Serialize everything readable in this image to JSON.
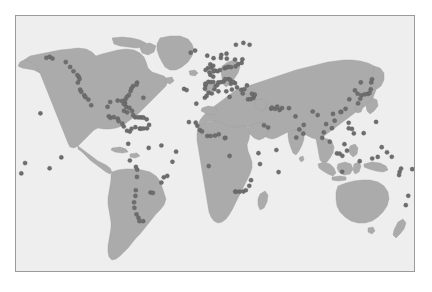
{
  "figure": {
    "title": "",
    "caption": "",
    "width": 432,
    "height": 292,
    "background_color": "#ffffff"
  },
  "map": {
    "frame": {
      "x": 15,
      "y": 15,
      "width": 400,
      "height": 257,
      "border_color": "#9a9a9a",
      "border_width": 1
    },
    "ocean_color": "#eeeeee",
    "land_color": "#ababab",
    "land_outline_color": "#9c9c9c",
    "point_fill_color": "#6e6e6e",
    "point_stroke_color": "#595959",
    "point_radius": 2.1,
    "projection": "equirectangular",
    "lon_range": [
      -180,
      180
    ],
    "lat_range": [
      -90,
      90
    ],
    "graticule": false,
    "axis_labels": false,
    "tick_labels": false,
    "legend": false
  },
  "chart_data": {
    "type": "scatter",
    "title": "",
    "xlabel": "Longitude",
    "ylabel": "Latitude",
    "xlim": [
      -180,
      180
    ],
    "ylim": [
      -90,
      90
    ],
    "grid": false,
    "legend_position": "none",
    "marker": {
      "shape": "circle",
      "size": 2.1,
      "color": "#6e6e6e"
    },
    "series": [
      {
        "name": "sample-locations",
        "count": 201,
        "regions": {
          "north_america_west": 16,
          "north_america_east": 14,
          "caribbean_central_america": 27,
          "south_america": 19,
          "europe_mediterranean": 41,
          "africa": 11,
          "middle_east_south_asia": 13,
          "east_asia_japan": 17,
          "southeast_asia_oceania": 29,
          "open_ocean_islands": 14
        },
        "points": [
          [
            -152.5,
            60.5
          ],
          [
            -149.5,
            61.2
          ],
          [
            -147.0,
            60.0
          ],
          [
            -135.0,
            57.5
          ],
          [
            -131.0,
            54.0
          ],
          [
            -128.0,
            51.0
          ],
          [
            -124.5,
            48.3
          ],
          [
            -123.2,
            47.0
          ],
          [
            -122.5,
            45.5
          ],
          [
            -124.0,
            43.0
          ],
          [
            -122.0,
            38.0
          ],
          [
            -121.0,
            36.5
          ],
          [
            -118.2,
            34.0
          ],
          [
            -117.2,
            32.7
          ],
          [
            -114.5,
            31.0
          ],
          [
            -112.0,
            27.0
          ],
          [
            -70.5,
            43.0
          ],
          [
            -71.0,
            41.5
          ],
          [
            -74.0,
            40.6
          ],
          [
            -75.5,
            39.0
          ],
          [
            -76.4,
            37.0
          ],
          [
            -77.9,
            34.2
          ],
          [
            -79.9,
            32.8
          ],
          [
            -81.1,
            31.0
          ],
          [
            -81.4,
            28.5
          ],
          [
            -80.2,
            25.8
          ],
          [
            -82.5,
            27.8
          ],
          [
            -84.3,
            30.0
          ],
          [
            -88.0,
            30.3
          ],
          [
            -94.8,
            29.3
          ],
          [
            -97.2,
            25.9
          ],
          [
            -96.0,
            19.2
          ],
          [
            -94.5,
            18.1
          ],
          [
            -91.5,
            18.6
          ],
          [
            -88.0,
            17.5
          ],
          [
            -87.2,
            15.8
          ],
          [
            -83.9,
            14.0
          ],
          [
            -82.5,
            12.0
          ],
          [
            -79.6,
            9.0
          ],
          [
            -77.0,
            8.4
          ],
          [
            -75.5,
            10.4
          ],
          [
            -72.0,
            11.5
          ],
          [
            -68.0,
            10.5
          ],
          [
            -66.9,
            10.5
          ],
          [
            -64.6,
            10.6
          ],
          [
            -61.5,
            10.7
          ],
          [
            -82.3,
            23.1
          ],
          [
            -79.5,
            22.0
          ],
          [
            -77.4,
            25.1
          ],
          [
            -75.0,
            23.0
          ],
          [
            -74.0,
            20.0
          ],
          [
            -72.3,
            18.5
          ],
          [
            -70.0,
            18.5
          ],
          [
            -68.0,
            18.4
          ],
          [
            -66.1,
            18.4
          ],
          [
            -64.7,
            18.3
          ],
          [
            -61.8,
            17.1
          ],
          [
            -78.5,
            -0.2
          ],
          [
            -77.0,
            -12.0
          ],
          [
            -71.5,
            -16.5
          ],
          [
            -70.4,
            -18.5
          ],
          [
            -70.6,
            -23.6
          ],
          [
            -71.6,
            -33.0
          ],
          [
            -72.0,
            -37.0
          ],
          [
            -73.2,
            -41.5
          ],
          [
            -72.9,
            -45.4
          ],
          [
            -71.0,
            -50.0
          ],
          [
            -69.2,
            -52.5
          ],
          [
            -68.3,
            -54.8
          ],
          [
            -65.0,
            -54.8
          ],
          [
            -58.4,
            -34.6
          ],
          [
            -56.2,
            -34.9
          ],
          [
            -48.5,
            -27.6
          ],
          [
            -46.3,
            -23.9
          ],
          [
            -43.2,
            -22.9
          ],
          [
            -38.5,
            -12.9
          ],
          [
            -35.2,
            -5.8
          ],
          [
            -60.0,
            -3.1
          ],
          [
            -48.5,
            -1.4
          ],
          [
            -9.1,
            38.7
          ],
          [
            -8.6,
            41.1
          ],
          [
            -8.7,
            42.2
          ],
          [
            -6.0,
            43.5
          ],
          [
            -3.8,
            43.4
          ],
          [
            -1.5,
            43.4
          ],
          [
            -0.5,
            38.3
          ],
          [
            0.6,
            40.6
          ],
          [
            2.2,
            41.4
          ],
          [
            3.0,
            43.1
          ],
          [
            5.4,
            43.3
          ],
          [
            7.8,
            43.7
          ],
          [
            9.2,
            45.4
          ],
          [
            12.3,
            45.4
          ],
          [
            13.8,
            44.9
          ],
          [
            14.4,
            42.1
          ],
          [
            15.3,
            38.1
          ],
          [
            18.1,
            42.6
          ],
          [
            16.4,
            43.5
          ],
          [
            19.9,
            39.6
          ],
          [
            23.7,
            37.9
          ],
          [
            25.1,
            35.3
          ],
          [
            26.5,
            38.3
          ],
          [
            28.9,
            41.0
          ],
          [
            29.9,
            31.2
          ],
          [
            32.3,
            31.3
          ],
          [
            34.8,
            32.1
          ],
          [
            35.5,
            33.9
          ],
          [
            35.9,
            34.6
          ],
          [
            33.4,
            35.1
          ],
          [
            -4.2,
            48.4
          ],
          [
            -1.6,
            47.2
          ],
          [
            2.4,
            51.0
          ],
          [
            4.5,
            51.9
          ],
          [
            8.8,
            53.1
          ],
          [
            10.0,
            53.6
          ],
          [
            12.1,
            54.1
          ],
          [
            14.5,
            53.9
          ],
          [
            18.6,
            54.4
          ],
          [
            21.0,
            56.0
          ],
          [
            24.1,
            56.9
          ],
          [
            24.8,
            59.4
          ],
          [
            18.1,
            59.3
          ],
          [
            10.7,
            59.9
          ],
          [
            5.3,
            60.4
          ],
          [
            5.7,
            62.5
          ],
          [
            10.4,
            63.4
          ],
          [
            18.9,
            69.7
          ],
          [
            25.7,
            71.0
          ],
          [
            31.3,
            69.7
          ],
          [
            -6.3,
            53.3
          ],
          [
            -8.5,
            51.9
          ],
          [
            -3.0,
            53.4
          ],
          [
            -4.2,
            55.9
          ],
          [
            -1.6,
            54.9
          ],
          [
            0.1,
            51.5
          ],
          [
            -1.4,
            50.9
          ],
          [
            -5.0,
            50.2
          ],
          [
            -22.0,
            64.1
          ],
          [
            -18.0,
            65.6
          ],
          [
            -7.0,
            62.0
          ],
          [
            -1.3,
            60.2
          ],
          [
            -9.2,
            32.3
          ],
          [
            -7.6,
            33.6
          ],
          [
            -5.8,
            35.8
          ],
          [
            -2.9,
            35.3
          ],
          [
            3.1,
            36.8
          ],
          [
            10.2,
            36.8
          ],
          [
            13.2,
            32.9
          ],
          [
            -17.4,
            14.7
          ],
          [
            -16.0,
            12.5
          ],
          [
            -13.7,
            9.5
          ],
          [
            -11.8,
            8.5
          ],
          [
            -7.0,
            5.3
          ],
          [
            -4.0,
            5.3
          ],
          [
            0.0,
            5.6
          ],
          [
            3.4,
            6.5
          ],
          [
            9.4,
            4.0
          ],
          [
            8.8,
            3.8
          ],
          [
            13.2,
            -8.8
          ],
          [
            18.4,
            -33.9
          ],
          [
            18.9,
            -34.1
          ],
          [
            22.2,
            -34.0
          ],
          [
            25.6,
            -33.9
          ],
          [
            27.9,
            -33.0
          ],
          [
            31.0,
            -29.9
          ],
          [
            32.6,
            -25.9
          ],
          [
            40.7,
            -14.5
          ],
          [
            39.3,
            -6.8
          ],
          [
            44.3,
            12.8
          ],
          [
            48.0,
            11.3
          ],
          [
            50.8,
            24.6
          ],
          [
            51.5,
            25.3
          ],
          [
            54.4,
            24.5
          ],
          [
            56.3,
            26.0
          ],
          [
            58.4,
            23.6
          ],
          [
            60.6,
            25.0
          ],
          [
            66.9,
            24.9
          ],
          [
            72.8,
            19.1
          ],
          [
            76.3,
            9.9
          ],
          [
            80.3,
            13.1
          ],
          [
            79.9,
            6.9
          ],
          [
            88.4,
            22.6
          ],
          [
            92.9,
            20.1
          ],
          [
            98.4,
            7.9
          ],
          [
            100.5,
            13.7
          ],
          [
            103.8,
            1.3
          ],
          [
            105.8,
            10.8
          ],
          [
            106.7,
            20.9
          ],
          [
            108.2,
            16.1
          ],
          [
            110.3,
            -7.0
          ],
          [
            112.7,
            -7.2
          ],
          [
            115.2,
            -8.7
          ],
          [
            117.1,
            -0.5
          ],
          [
            119.4,
            -5.1
          ],
          [
            120.9,
            14.6
          ],
          [
            121.0,
            10.7
          ],
          [
            123.9,
            10.3
          ],
          [
            125.6,
            7.1
          ],
          [
            126.6,
            37.5
          ],
          [
            129.0,
            35.1
          ],
          [
            129.4,
            28.3
          ],
          [
            131.4,
            31.6
          ],
          [
            132.5,
            34.0
          ],
          [
            135.5,
            34.7
          ],
          [
            138.4,
            35.0
          ],
          [
            139.8,
            35.7
          ],
          [
            140.9,
            38.3
          ],
          [
            141.3,
            43.1
          ],
          [
            142.0,
            45.3
          ],
          [
            131.9,
            43.1
          ],
          [
            121.5,
            31.2
          ],
          [
            118.1,
            24.5
          ],
          [
            114.2,
            22.3
          ],
          [
            113.5,
            22.2
          ],
          [
            130.9,
            -12.5
          ],
          [
            142.2,
            -10.6
          ],
          [
            147.2,
            -9.5
          ],
          [
            150.8,
            -2.6
          ],
          [
            155.6,
            -6.2
          ],
          [
            159.9,
            -9.4
          ],
          [
            166.5,
            -22.3
          ],
          [
            168.3,
            -17.7
          ],
          [
            174.8,
            -36.9
          ],
          [
            172.6,
            -43.5
          ],
          [
            115.0,
            -20.0
          ],
          [
            -157.9,
            21.3
          ],
          [
            -149.6,
            -17.5
          ],
          [
            -139.0,
            -9.8
          ],
          [
            -171.8,
            -13.8
          ],
          [
            -175.2,
            -21.1
          ],
          [
            178.4,
            -18.1
          ],
          [
            145.7,
            15.2
          ],
          [
            134.5,
            7.3
          ],
          [
            -28.0,
            38.5
          ],
          [
            -25.7,
            37.7
          ],
          [
            -16.9,
            28.1
          ],
          [
            -23.6,
            15.1
          ],
          [
            -64.8,
            32.3
          ],
          [
            -59.6,
            13.1
          ],
          [
            -5.7,
            -15.9
          ],
          [
            55.5,
            -4.6
          ],
          [
            57.5,
            -20.2
          ],
          [
            73.5,
            4.2
          ],
          [
            97.0,
            4.0
          ],
          [
            167.0,
            -20.0
          ]
        ]
      }
    ]
  }
}
